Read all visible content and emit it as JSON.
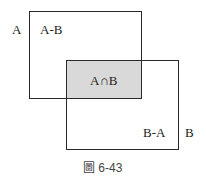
{
  "diagram": {
    "type": "set-venn-rectangles",
    "sets": [
      {
        "name": "A",
        "label": "A"
      },
      {
        "name": "B",
        "label": "B"
      }
    ],
    "regions": {
      "a_minus_b": "A-B",
      "intersection": "A∩B",
      "b_minus_a": "B-A"
    },
    "intersection_fill": "#d9d9d9",
    "caption": "圖 6-43"
  }
}
